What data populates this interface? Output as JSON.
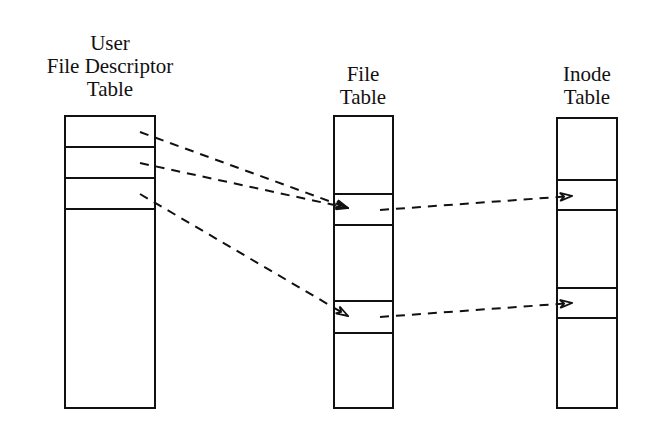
{
  "diagram": {
    "user_fd_table": {
      "title_lines": [
        "User",
        "File Descriptor",
        "Table"
      ]
    },
    "file_table": {
      "title_lines": [
        "File",
        "Table"
      ]
    },
    "inode_table": {
      "title_lines": [
        "Inode",
        "Table"
      ]
    }
  }
}
